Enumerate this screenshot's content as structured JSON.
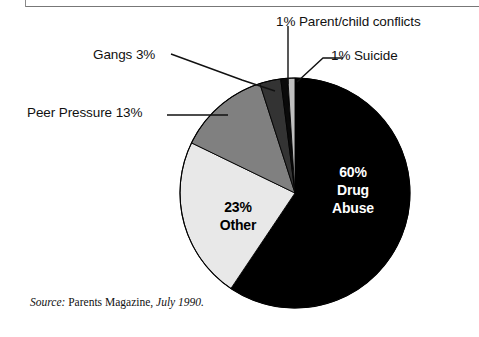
{
  "chart_data": {
    "type": "pie",
    "title": "",
    "subtitle": "",
    "xlabel": "",
    "ylabel": "",
    "legend_position": "none",
    "grid": false,
    "start_angle_deg": 0,
    "direction": "clockwise",
    "units": "percent",
    "total": 101,
    "categories": [
      "Drug Abuse",
      "Other",
      "Peer Pressure",
      "Gangs",
      "Parent/child conflicts",
      "Suicide"
    ],
    "values": [
      60,
      23,
      13,
      3,
      1,
      1
    ],
    "slices": [
      {
        "name": "Drug Abuse",
        "value": 60,
        "label": "60%\nDrug\nAbuse",
        "label_placement": "inside",
        "fill": "#000000",
        "text_color": "#FFFFFF"
      },
      {
        "name": "Other",
        "value": 23,
        "label": "23%\nOther",
        "label_placement": "inside",
        "fill": "#E8E8E8",
        "text_color": "#000000"
      },
      {
        "name": "Peer Pressure",
        "value": 13,
        "label": "Peer Pressure 13%",
        "label_placement": "callout",
        "fill": "#808080",
        "text_color": "#111111"
      },
      {
        "name": "Gangs",
        "value": 3,
        "label": "Gangs 3%",
        "label_placement": "callout",
        "fill": "#333333",
        "text_color": "#111111"
      },
      {
        "name": "Parent/child conflicts",
        "value": 1,
        "label": "1% Parent/child conflicts",
        "label_placement": "callout",
        "fill": "#0A0A0A",
        "text_color": "#111111"
      },
      {
        "name": "Suicide",
        "value": 1,
        "label": "1% Suicide",
        "label_placement": "callout",
        "fill": "#BFBFBF",
        "text_color": "#111111"
      }
    ]
  },
  "labels": {
    "parent_child": "1% Parent/child conflicts",
    "suicide": "1% Suicide",
    "gangs": "Gangs 3%",
    "peer_pressure": "Peer Pressure 13%",
    "drug_abuse": "60%\nDrug\nAbuse",
    "other": "23%\nOther"
  },
  "source": {
    "prefix": "Source:",
    "publication": "Parents Magazine,",
    "date": "July 1990."
  },
  "colors": {
    "background": "#FFFFFF",
    "outline": "#000000",
    "drug_abuse": "#000000",
    "other": "#E8E8E8",
    "peer_pressure": "#808080",
    "gangs": "#333333",
    "parent_child": "#0A0A0A",
    "suicide": "#BFBFBF",
    "rule": "#777777"
  }
}
